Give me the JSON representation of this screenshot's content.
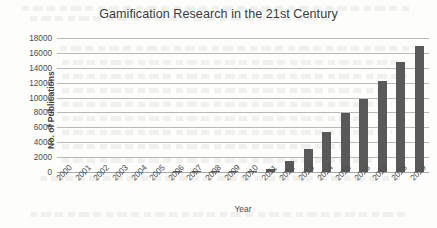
{
  "chart_data": {
    "type": "bar",
    "title": "Gamification Research in the 21st Century",
    "xlabel": "Year",
    "ylabel": "No. of Publications",
    "categories": [
      "2000",
      "2001",
      "2002",
      "2003",
      "2004",
      "2005",
      "2006",
      "2007",
      "2008",
      "2009",
      "2010",
      "2011",
      "2012",
      "2013",
      "2014",
      "2015",
      "2016",
      "2017",
      "2018",
      "2019"
    ],
    "values": [
      0,
      0,
      0,
      0,
      0,
      0,
      20,
      25,
      30,
      40,
      90,
      420,
      1500,
      3150,
      5400,
      7900,
      9850,
      12200,
      14800,
      16950
    ],
    "ylim": [
      0,
      18000
    ],
    "ytick_step": 2000,
    "yticks": [
      "18000",
      "16000",
      "14000",
      "12000",
      "10000",
      "8000",
      "6000",
      "4000",
      "2000",
      "0"
    ],
    "grid": true,
    "legend": false,
    "series": [
      {
        "name": "No. of Publications",
        "color": "#595959",
        "values": [
          0,
          0,
          0,
          0,
          0,
          0,
          20,
          25,
          30,
          40,
          90,
          420,
          1500,
          3150,
          5400,
          7900,
          9850,
          12200,
          14800,
          16950
        ]
      }
    ]
  },
  "colors": {
    "bar": "#595959",
    "grid": "#b9b9b9",
    "text": "#4a4a4a",
    "title": "#3b3b3b",
    "background": "#fdfdfc"
  }
}
